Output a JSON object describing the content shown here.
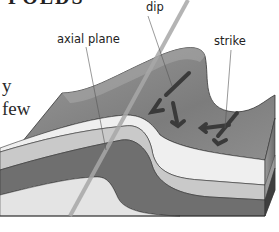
{
  "diagram": {
    "title_fragment": "FOLDS",
    "body_text_lines": [
      "y",
      "few"
    ],
    "labels": {
      "axial_plane": "axial plane",
      "dip": "dip",
      "strike": "strike"
    },
    "colors": {
      "top_surface": "#8a8a8a",
      "layer_light": "#ececec",
      "layer_mid": "#c4c4c4",
      "layer_dark": "#6e6e6e",
      "base": "#e4e4e4",
      "arrow": "#3a3a3a",
      "axial_plane_line": "#a8a8a8"
    }
  }
}
